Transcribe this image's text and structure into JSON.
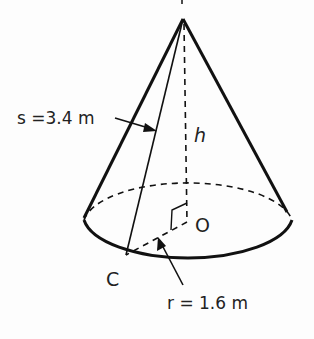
{
  "diagram": {
    "colors": {
      "stroke": "#111111",
      "text": "#222222",
      "background": "#fdfdfd"
    },
    "points": {
      "apex": {
        "label": "P",
        "x": 183,
        "y": 19
      },
      "center": {
        "label": "O",
        "x": 187,
        "y": 222
      },
      "base_point": {
        "label": "C",
        "x": 125,
        "y": 256
      }
    },
    "labels": {
      "slant": "s =3.4 m",
      "height": "h",
      "radius": "r = 1.6 m",
      "center": "O",
      "base_point": "C"
    },
    "measurements": {
      "slant_height": {
        "symbol": "s",
        "value": 3.4,
        "unit": "m"
      },
      "radius": {
        "symbol": "r",
        "value": 1.6,
        "unit": "m"
      },
      "height": {
        "symbol": "h",
        "value": null,
        "unit": ""
      }
    },
    "annotations": [
      "right-angle marker at O between h and r"
    ]
  }
}
